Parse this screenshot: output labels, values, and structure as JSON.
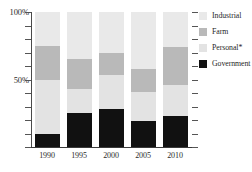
{
  "chart_data": {
    "type": "bar",
    "subtype": "stacked-percentage",
    "title": "",
    "xlabel": "",
    "ylabel": "",
    "categories": [
      "1990",
      "1995",
      "2000",
      "2005",
      "2010"
    ],
    "ylim": [
      0,
      100
    ],
    "ytick_labels": [
      "50%",
      "100%"
    ],
    "ytick_values": [
      50,
      100
    ],
    "grid": false,
    "legend_position": "right",
    "series": [
      {
        "name": "Government",
        "color": "#111111",
        "values": [
          10,
          25,
          28,
          19,
          23
        ]
      },
      {
        "name": "Personal*",
        "color": "#e3e3e3",
        "values": [
          40,
          18,
          25,
          22,
          23
        ]
      },
      {
        "name": "Farm",
        "color": "#b9b9b9",
        "values": [
          25,
          22,
          17,
          17,
          28
        ]
      },
      {
        "name": "Industrial",
        "color": "#e9e9e9",
        "values": [
          25,
          35,
          30,
          42,
          26
        ]
      }
    ]
  },
  "legend": {
    "entries": [
      {
        "label": "Industrial",
        "color": "#e9e9e9"
      },
      {
        "label": "Farm",
        "color": "#b9b9b9"
      },
      {
        "label": "Personal*",
        "color": "#e3e3e3"
      },
      {
        "label": "Government",
        "color": "#111111"
      }
    ]
  },
  "axis": {
    "y_labels": [
      {
        "text": "100%",
        "value": 100
      },
      {
        "text": "50%",
        "value": 50
      }
    ],
    "x_labels": [
      "1990",
      "1995",
      "2000",
      "2005",
      "2010"
    ],
    "tick_count": 10
  },
  "colors": {
    "industrial": "#e9e9e9",
    "farm": "#b9b9b9",
    "personal": "#e3e3e3",
    "government": "#111111",
    "axis": "#4a4a4a",
    "text": "#1f1f1f",
    "background": "#ffffff"
  }
}
